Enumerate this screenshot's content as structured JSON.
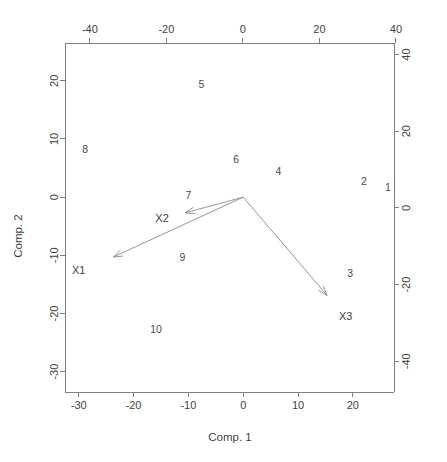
{
  "chart_data": {
    "type": "scatter",
    "title": "",
    "subtitle": "",
    "xlabel": "Comp. 1",
    "ylabel": "Comp. 2",
    "x_top_label": "",
    "y_right_label": "",
    "xlim": [
      -32.5,
      27.5
    ],
    "ylim": [
      -33.5,
      26.5
    ],
    "xlim_top": [
      -46.5,
      39.5
    ],
    "ylim_right": [
      -48,
      43
    ],
    "grid": false,
    "legend": "none",
    "bottom_ticks": [
      {
        "label": "-30",
        "value": -30
      },
      {
        "label": "-20",
        "value": -20
      },
      {
        "label": "-10",
        "value": -10
      },
      {
        "label": "0",
        "value": 0
      },
      {
        "label": "10",
        "value": 10
      },
      {
        "label": "20",
        "value": 20
      }
    ],
    "left_ticks": [
      {
        "label": "20",
        "value": 20
      },
      {
        "label": "10",
        "value": 10
      },
      {
        "label": "0",
        "value": 0
      },
      {
        "label": "-10",
        "value": -10
      },
      {
        "label": "-20",
        "value": -20
      },
      {
        "label": "-30",
        "value": -30
      }
    ],
    "top_ticks": [
      {
        "label": "-40",
        "value": -40
      },
      {
        "label": "-20",
        "value": -20
      },
      {
        "label": "0",
        "value": 0
      },
      {
        "label": "20",
        "value": 20
      },
      {
        "label": "40",
        "value": 40
      }
    ],
    "right_ticks": [
      {
        "label": "40",
        "value": 40
      },
      {
        "label": "20",
        "value": 20
      },
      {
        "label": "0",
        "value": 0
      },
      {
        "label": "-20",
        "value": -20
      },
      {
        "label": "-40",
        "value": -40
      }
    ],
    "observations": [
      {
        "label": "1",
        "x": 26.4,
        "y": 1.7
      },
      {
        "label": "2",
        "x": 22.0,
        "y": 2.7
      },
      {
        "label": "3",
        "x": 19.5,
        "y": -13.0
      },
      {
        "label": "4",
        "x": 6.4,
        "y": 4.5
      },
      {
        "label": "5",
        "x": -7.6,
        "y": 19.5
      },
      {
        "label": "6",
        "x": -1.3,
        "y": 6.6
      },
      {
        "label": "7",
        "x": -10.0,
        "y": 0.3
      },
      {
        "label": "8",
        "x": -28.8,
        "y": 8.3
      },
      {
        "label": "9",
        "x": -11.1,
        "y": -10.3
      },
      {
        "label": "10",
        "x": -15.9,
        "y": -22.6
      }
    ],
    "variable_arrows": [
      {
        "label": "X1",
        "tip_x": -23.7,
        "tip_y": -10.3,
        "label_x": -30.0,
        "label_y": -12.5
      },
      {
        "label": "X2",
        "tip_x": -10.6,
        "tip_y": -2.7,
        "label_x": -14.8,
        "label_y": -3.5
      },
      {
        "label": "X3",
        "tip_x": 15.3,
        "tip_y": -16.9,
        "label_x": 18.7,
        "label_y": -20.5
      }
    ],
    "arrow_origin": {
      "x": 0,
      "y": 0
    },
    "colors": {
      "axis": "#7f7f7f",
      "text": "#3f3f3f",
      "observation": "#4a4a4a",
      "arrow": "#8a8a8a",
      "background": "#ffffff"
    }
  }
}
